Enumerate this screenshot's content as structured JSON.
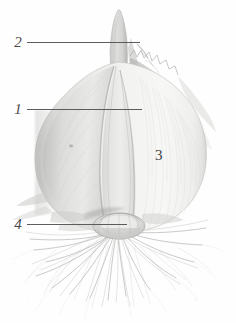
{
  "figure": {
    "background_color": "#fefefe",
    "width": 236,
    "height": 323,
    "specimen": "onion-bulb-with-roots"
  },
  "callouts": [
    {
      "number": "2",
      "target": "shoot-tip",
      "has_leader_line": true
    },
    {
      "number": "1",
      "target": "fleshy-scale-leaf",
      "has_leader_line": true
    },
    {
      "number": "3",
      "target": "bulb-body",
      "has_leader_line": false
    },
    {
      "number": "4",
      "target": "basal-plate",
      "has_leader_line": true
    }
  ],
  "colors": {
    "leader_line": "#5c5c5c",
    "label_text": "#4a4a4a",
    "bulb_light": "#f4f4f3",
    "bulb_mid": "#d9d9d7",
    "bulb_shadow": "#b6b6b4",
    "root_stroke": "#b9b9b7",
    "tunic_edge": "#9a9a98"
  }
}
